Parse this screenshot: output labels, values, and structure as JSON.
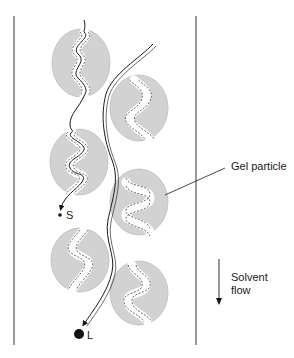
{
  "diagram": {
    "labels": {
      "gel_particle": "Gel particle",
      "solvent_flow_line1": "Solvent",
      "solvent_flow_line2": "flow",
      "small_molecule": "S",
      "large_molecule": "L"
    },
    "colors": {
      "particle_fill": "#d2d2d2",
      "particle_stroke": "#9a9a9a",
      "pore_fill": "#ffffff",
      "line": "#1a1a1a",
      "wall": "#555555"
    },
    "column": {
      "left_x": 14,
      "right_x": 196,
      "top_y": 16,
      "bottom_y": 345
    },
    "particles": [
      {
        "id": "p1",
        "cx": 81,
        "cy": 63,
        "rx": 29,
        "ry": 34,
        "pore": "entered"
      },
      {
        "id": "p2",
        "cx": 139,
        "cy": 108,
        "rx": 29,
        "ry": 33,
        "pore": "empty"
      },
      {
        "id": "p3",
        "cx": 79,
        "cy": 162,
        "rx": 29,
        "ry": 33,
        "pore": "entered"
      },
      {
        "id": "p4",
        "cx": 139,
        "cy": 202,
        "rx": 29,
        "ry": 33,
        "pore": "empty"
      },
      {
        "id": "p5",
        "cx": 80,
        "cy": 260,
        "rx": 29,
        "ry": 32,
        "pore": "empty"
      },
      {
        "id": "p6",
        "cx": 139,
        "cy": 293,
        "rx": 29,
        "ry": 32,
        "pore": "empty"
      }
    ]
  }
}
